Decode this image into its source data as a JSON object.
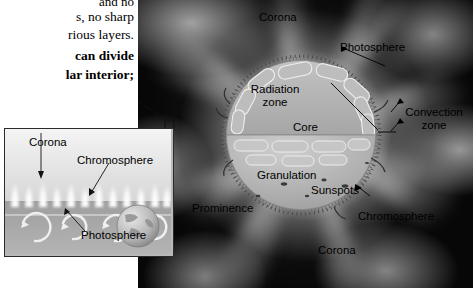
{
  "book_text": {
    "lines": [
      "and no",
      "s, no  sharp",
      "rious layers.",
      "can divide",
      "lar interior;"
    ]
  },
  "main_figure": {
    "name": "sun-structure-diagram",
    "background_color": "#070707",
    "sun_fill_color": "#b0b0b0",
    "labels": [
      {
        "id": "corona-top",
        "text": "Corona",
        "x": 259,
        "y": 11,
        "align": "left"
      },
      {
        "id": "photosphere",
        "text": "Photosphere",
        "x": 340,
        "y": 41,
        "align": "left"
      },
      {
        "id": "radiation-zone",
        "text": "Radiation\nzone",
        "x": 276,
        "y": 89,
        "align": "center"
      },
      {
        "id": "convection-zone",
        "text": "Convection\nzone",
        "x": 398,
        "y": 112,
        "align": "left"
      },
      {
        "id": "core",
        "text": "Core",
        "x": 293,
        "y": 127,
        "align": "left"
      },
      {
        "id": "granulation",
        "text": "Granulation",
        "x": 257,
        "y": 175,
        "align": "left"
      },
      {
        "id": "sunspots",
        "text": "Sunspots",
        "x": 311,
        "y": 190,
        "align": "left"
      },
      {
        "id": "prominence",
        "text": "Prominence",
        "x": 192,
        "y": 208,
        "align": "left"
      },
      {
        "id": "chromosphere",
        "text": "Chromosphere",
        "x": 358,
        "y": 216,
        "align": "left"
      },
      {
        "id": "corona-bottom",
        "text": "Corona",
        "x": 318,
        "y": 250,
        "align": "left"
      }
    ]
  },
  "inset_figure": {
    "name": "solar-atmosphere-inset",
    "border_color": "#2b2b2b",
    "labels": [
      {
        "id": "inset-corona",
        "text": "Corona",
        "x": 28,
        "y": 139
      },
      {
        "id": "inset-chromosphere",
        "text": "Chromosphere",
        "x": 76,
        "y": 157
      },
      {
        "id": "inset-photosphere",
        "text": "Photosphere",
        "x": 80,
        "y": 232
      }
    ]
  }
}
